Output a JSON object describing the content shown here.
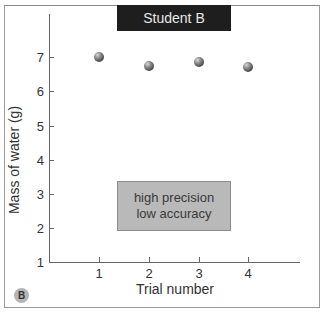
{
  "chart_data": {
    "type": "scatter",
    "title": "Student B",
    "xlabel": "Trial number",
    "ylabel": "Mass of water (g)",
    "x": [
      1,
      2,
      3,
      4
    ],
    "series": [
      {
        "name": "Student B",
        "values": [
          7.0,
          6.73,
          6.85,
          6.7
        ]
      }
    ],
    "x_ticks": [
      "1",
      "2",
      "3",
      "4"
    ],
    "y_ticks": [
      "1",
      "2",
      "3",
      "4",
      "5",
      "6",
      "7"
    ],
    "xlim": [
      0,
      5
    ],
    "ylim": [
      1,
      8.1
    ],
    "grid": false,
    "legend": null,
    "annotations": [
      {
        "text": [
          "high precision",
          "low accuracy"
        ],
        "position": "inside plot, centered near x=2.5, y=2.7"
      }
    ],
    "panel_label": "B"
  },
  "title": "Student B",
  "axes": {
    "x_title": "Trial number",
    "y_title": "Mass of water (g)",
    "x_ticks": [
      {
        "label": "1",
        "px": 99
      },
      {
        "label": "2",
        "px": 149
      },
      {
        "label": "3",
        "px": 199
      },
      {
        "label": "4",
        "px": 248
      }
    ],
    "y_ticks": [
      {
        "label": "7",
        "px": 57
      },
      {
        "label": "6",
        "px": 91
      },
      {
        "label": "5",
        "px": 126
      },
      {
        "label": "4",
        "px": 160
      },
      {
        "label": "3",
        "px": 194
      },
      {
        "label": "2",
        "px": 228
      },
      {
        "label": "1",
        "px": 262
      }
    ]
  },
  "points": [
    {
      "x": 1,
      "y": 7.0,
      "px": 99,
      "py": 57
    },
    {
      "x": 2,
      "y": 6.73,
      "px": 149,
      "py": 66
    },
    {
      "x": 3,
      "y": 6.85,
      "px": 199,
      "py": 62
    },
    {
      "x": 4,
      "y": 6.7,
      "px": 248,
      "py": 67
    }
  ],
  "annotation": {
    "line1": "high precision",
    "line2": "low accuracy"
  },
  "panel_label": "B",
  "colors": {
    "title_bg": "#1e1e1e",
    "title_fg": "#e8e8e8",
    "annotation_bg": "#b9b9b9",
    "point": "#555555",
    "axis": "#666666"
  }
}
